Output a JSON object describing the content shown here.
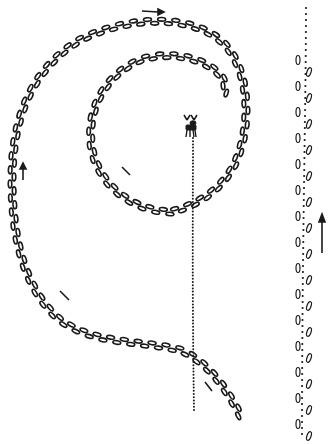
{
  "diagram": {
    "colors": {
      "ink": "#1a1a1a",
      "background": "#ffffff"
    },
    "elements": [
      {
        "id": "outer-loop",
        "type": "hoof-print-track",
        "shape": "large loop"
      },
      {
        "id": "inner-spiral",
        "type": "hoof-print-track",
        "shape": "inner spiral"
      },
      {
        "id": "dotted-trail",
        "type": "dotted-track",
        "shape": "vertical line from moose down"
      },
      {
        "id": "right-track",
        "type": "mixed-track",
        "shape": "vertical line"
      },
      {
        "id": "moose",
        "type": "icon"
      }
    ],
    "arrows": [
      {
        "id": "top-arrow",
        "direction": "right"
      },
      {
        "id": "left-arrow",
        "direction": "up"
      },
      {
        "id": "inner-arrow",
        "direction": "down-right"
      },
      {
        "id": "lower-left-arrow",
        "direction": "up-left"
      },
      {
        "id": "bottom-arrow",
        "direction": "up-left"
      },
      {
        "id": "right-arrow",
        "direction": "up"
      }
    ]
  }
}
